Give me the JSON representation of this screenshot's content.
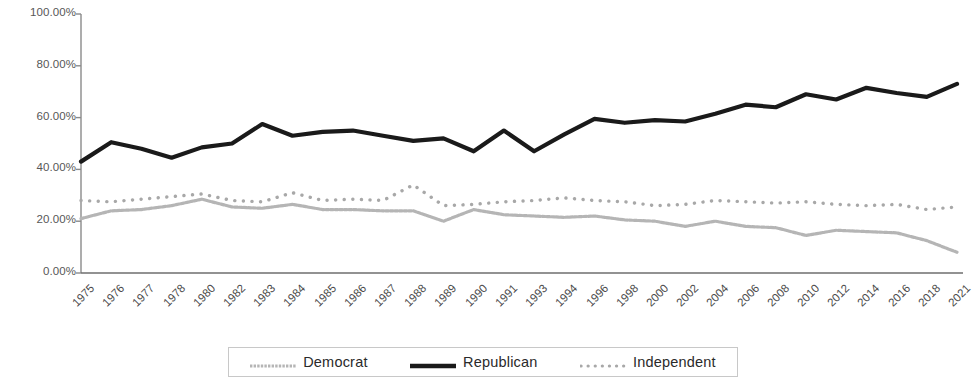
{
  "chart_data": {
    "type": "line",
    "title": "",
    "subtitle": "",
    "xlabel": "",
    "ylabel": "",
    "ylim": [
      0,
      100
    ],
    "ytick_labels": [
      "0.00%",
      "20.00%",
      "40.00%",
      "60.00%",
      "80.00%",
      "100.00%"
    ],
    "ytick_values": [
      0,
      20,
      40,
      60,
      80,
      100
    ],
    "grid": false,
    "legend_position": "bottom",
    "categories": [
      "1975",
      "1976",
      "1977",
      "1978",
      "1980",
      "1982",
      "1983",
      "1984",
      "1985",
      "1986",
      "1987",
      "1988",
      "1989",
      "1990",
      "1991",
      "1993",
      "1994",
      "1996",
      "1998",
      "2000",
      "2002",
      "2004",
      "2006",
      "2008",
      "2010",
      "2012",
      "2014",
      "2016",
      "2018",
      "2021"
    ],
    "series": [
      {
        "name": "Democrat",
        "color": "#b5b5b5",
        "style": "solid-thin",
        "values": [
          21.0,
          24.0,
          24.5,
          26.0,
          28.5,
          25.5,
          25.0,
          26.5,
          24.5,
          24.5,
          24.0,
          24.0,
          20.0,
          24.5,
          22.5,
          22.0,
          21.5,
          22.0,
          20.5,
          20.0,
          18.0,
          20.0,
          18.0,
          17.5,
          14.5,
          16.5,
          16.0,
          15.5,
          12.5,
          8.0
        ]
      },
      {
        "name": "Republican",
        "color": "#1a1a1a",
        "style": "solid-thick",
        "values": [
          43.0,
          50.5,
          48.0,
          44.5,
          48.5,
          50.0,
          57.5,
          53.0,
          54.5,
          55.0,
          53.0,
          51.0,
          52.0,
          47.0,
          55.0,
          47.0,
          53.5,
          59.5,
          58.0,
          59.0,
          58.5,
          61.5,
          65.0,
          64.0,
          69.0,
          67.0,
          71.5,
          69.5,
          68.0,
          73.0
        ]
      },
      {
        "name": "Independent",
        "color": "#a8a8a8",
        "style": "dotted",
        "values": [
          28.0,
          27.5,
          28.5,
          29.5,
          30.5,
          28.0,
          27.5,
          31.0,
          28.0,
          28.5,
          28.0,
          34.0,
          26.0,
          26.5,
          27.5,
          28.0,
          29.0,
          28.0,
          27.5,
          26.0,
          26.5,
          28.0,
          27.5,
          27.0,
          27.5,
          26.5,
          26.0,
          26.5,
          24.5,
          25.5
        ]
      }
    ]
  },
  "legend": {
    "items": [
      {
        "label": "Democrat",
        "swatch": "democrat-swatch"
      },
      {
        "label": "Republican",
        "swatch": "republican-swatch"
      },
      {
        "label": "Independent",
        "swatch": "independent-swatch"
      }
    ]
  }
}
